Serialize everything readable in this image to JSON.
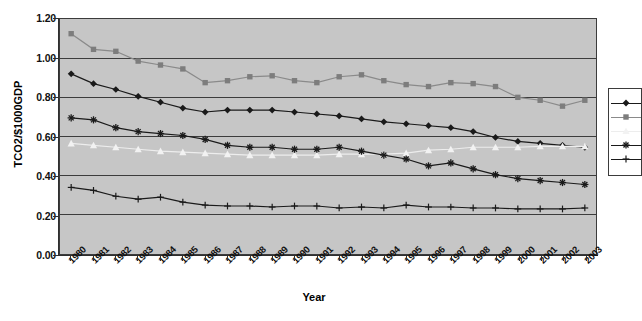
{
  "chart_data": {
    "type": "line",
    "title": "",
    "xlabel": "Year",
    "ylabel": "TCO2/$1000GDP",
    "grid": true,
    "legend_position": "right",
    "legend_clipped": true,
    "plot_background": "#c6c6c6",
    "xlim": [
      1980,
      2003
    ],
    "ylim": [
      0.0,
      1.2
    ],
    "ytick_step": 0.2,
    "yticks": [
      "0.00",
      "0.20",
      "0.40",
      "0.60",
      "0.80",
      "1.00",
      "1.20"
    ],
    "ytick_values": [
      0.0,
      0.2,
      0.4,
      0.6,
      0.8,
      1.0,
      1.2
    ],
    "categories": [
      "1980",
      "1981",
      "1982",
      "1983",
      "1984",
      "1985",
      "1986",
      "1987",
      "1988",
      "1989",
      "1990",
      "1991",
      "1992",
      "1993",
      "1994",
      "1995",
      "1996",
      "1997",
      "1998",
      "1999",
      "2000",
      "2001",
      "2002",
      "2003"
    ],
    "series": [
      {
        "name": "series-1",
        "marker": "diamond",
        "color": "#1a1a1a",
        "line_color": "#1a1a1a",
        "values": [
          0.92,
          0.87,
          0.84,
          0.805,
          0.775,
          0.745,
          0.725,
          0.735,
          0.735,
          0.735,
          0.725,
          0.715,
          0.705,
          0.69,
          0.675,
          0.665,
          0.655,
          0.645,
          0.625,
          0.595,
          0.575,
          0.565,
          0.555,
          0.545
        ]
      },
      {
        "name": "series-2",
        "marker": "square",
        "color": "#7d7d7d",
        "line_color": "#8a8a8a",
        "values": [
          1.125,
          1.045,
          1.035,
          0.985,
          0.965,
          0.945,
          0.875,
          0.885,
          0.905,
          0.91,
          0.885,
          0.875,
          0.905,
          0.915,
          0.885,
          0.865,
          0.855,
          0.875,
          0.87,
          0.855,
          0.8,
          0.785,
          0.755,
          0.785
        ]
      },
      {
        "name": "series-3",
        "marker": "triangle",
        "color": "#f2f2f2",
        "line_color": "#ededed",
        "values": [
          0.565,
          0.555,
          0.545,
          0.535,
          0.525,
          0.52,
          0.515,
          0.51,
          0.505,
          0.505,
          0.505,
          0.505,
          0.51,
          0.51,
          0.51,
          0.515,
          0.53,
          0.535,
          0.545,
          0.545,
          0.545,
          0.55,
          0.55,
          0.55
        ]
      },
      {
        "name": "series-4",
        "marker": "asterisk",
        "color": "#1a1a1a",
        "line_color": "#1a1a1a",
        "values": [
          0.695,
          0.685,
          0.645,
          0.625,
          0.615,
          0.605,
          0.585,
          0.555,
          0.545,
          0.545,
          0.535,
          0.535,
          0.545,
          0.525,
          0.505,
          0.485,
          0.45,
          0.465,
          0.435,
          0.405,
          0.385,
          0.375,
          0.365,
          0.355
        ]
      },
      {
        "name": "series-5",
        "marker": "plus",
        "color": "#1a1a1a",
        "line_color": "#1a1a1a",
        "values": [
          0.34,
          0.325,
          0.295,
          0.28,
          0.29,
          0.265,
          0.25,
          0.245,
          0.245,
          0.24,
          0.245,
          0.245,
          0.235,
          0.24,
          0.235,
          0.25,
          0.24,
          0.24,
          0.235,
          0.235,
          0.23,
          0.23,
          0.23,
          0.235
        ]
      }
    ]
  },
  "legend": {
    "entries": [
      {
        "marker": "diamond",
        "label": ""
      },
      {
        "marker": "square",
        "label": ""
      },
      {
        "marker": "triangle",
        "label": ""
      },
      {
        "marker": "asterisk",
        "label": ""
      },
      {
        "marker": "plus",
        "label": ""
      }
    ]
  }
}
